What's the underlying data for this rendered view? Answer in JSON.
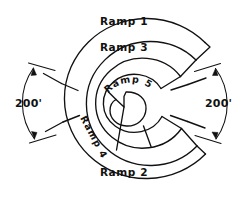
{
  "diagram": {
    "ramps": [
      {
        "id": "ramp-1",
        "label": "Ramp 1"
      },
      {
        "id": "ramp-2",
        "label": "Ramp 2"
      },
      {
        "id": "ramp-3",
        "label": "Ramp 3"
      },
      {
        "id": "ramp-4",
        "label": "Ramp 4"
      },
      {
        "id": "ramp-5",
        "label": "Ramp 5"
      }
    ],
    "dimensions": [
      {
        "id": "dim-left",
        "label": "200'",
        "side": "left"
      },
      {
        "id": "dim-right",
        "label": "200'",
        "side": "right"
      }
    ],
    "colors": {
      "ink": "#111111",
      "background": "#ffffff"
    }
  }
}
